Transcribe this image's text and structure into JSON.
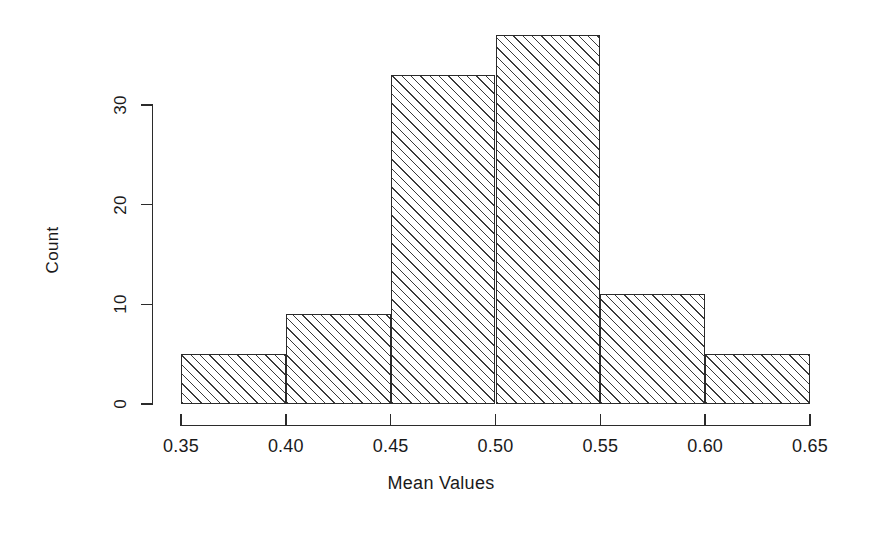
{
  "chart_data": {
    "type": "bar",
    "title": "",
    "subtitle": "",
    "xlabel": "Mean Values",
    "ylabel": "Count",
    "categories": [
      "0.35-0.40",
      "0.40-0.45",
      "0.45-0.50",
      "0.50-0.55",
      "0.55-0.60",
      "0.60-0.65"
    ],
    "bin_edges": [
      0.35,
      0.4,
      0.45,
      0.5,
      0.55,
      0.6,
      0.65
    ],
    "values": [
      5,
      9,
      33,
      37,
      11,
      5
    ],
    "xlim": [
      0.35,
      0.65
    ],
    "ylim": [
      0,
      30
    ],
    "xticks": [
      "0.35",
      "0.40",
      "0.45",
      "0.50",
      "0.55",
      "0.60",
      "0.65"
    ],
    "xtick_values": [
      0.35,
      0.4,
      0.45,
      0.5,
      0.55,
      0.6,
      0.65
    ],
    "yticks": [
      "0",
      "10",
      "20",
      "30"
    ],
    "ytick_values": [
      0,
      10,
      20,
      30
    ],
    "grid": false,
    "legend": false,
    "legend_position": "none",
    "bar_fill": "hatched-diagonal-45",
    "bar_border_color": "#2b2b2b",
    "background_color": "#ffffff"
  }
}
